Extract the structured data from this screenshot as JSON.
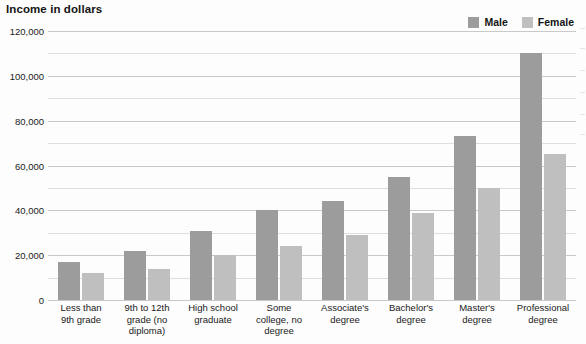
{
  "chart_title": "Income in dollars",
  "legend": {
    "position": "top-right",
    "entries": [
      {
        "label": "Male",
        "color": "#9c9c9c",
        "swatch_name": "legend-swatch-male"
      },
      {
        "label": "Female",
        "color": "#bfbfbf",
        "swatch_name": "legend-swatch-female"
      }
    ]
  },
  "y_axis": {
    "labels": [
      "120,000",
      "100,000",
      "80,000",
      "60,000",
      "40,000",
      "20,000",
      "0"
    ],
    "label_values": [
      120000,
      100000,
      80000,
      60000,
      40000,
      20000,
      0
    ],
    "gridline_values": [
      120000,
      110000,
      100000,
      90000,
      80000,
      70000,
      60000,
      50000,
      40000,
      30000,
      20000,
      10000,
      0
    ]
  },
  "x_axis": {
    "labels": [
      "Less than\n9th grade",
      "9th to 12th\ngrade (no\ndiploma)",
      "High school\ngraduate",
      "Some\ncollege, no\ndegree",
      "Associate's\ndegree",
      "Bachelor's\ndegree",
      "Master's\ndegree",
      "Professional\ndegree"
    ]
  },
  "chart_data": {
    "type": "bar",
    "title": "Income in dollars",
    "subtitle": "",
    "xlabel": "",
    "ylabel": "Income in dollars",
    "ylim": [
      0,
      120000
    ],
    "ytick_step": 10000,
    "ytick_label_step": 20000,
    "grid": true,
    "grid_axis": "y",
    "legend_position": "top-right",
    "categories": [
      "Less than 9th grade",
      "9th to 12th grade (no diploma)",
      "High school graduate",
      "Some college, no degree",
      "Associate's degree",
      "Bachelor's degree",
      "Master's degree",
      "Professional degree"
    ],
    "series": [
      {
        "name": "Male",
        "color": "#9c9c9c",
        "values": [
          17000,
          22000,
          31000,
          40000,
          44000,
          55000,
          73000,
          110000
        ]
      },
      {
        "name": "Female",
        "color": "#bfbfbf",
        "values": [
          12000,
          14000,
          20000,
          24000,
          29000,
          39000,
          50000,
          65000
        ]
      }
    ]
  }
}
